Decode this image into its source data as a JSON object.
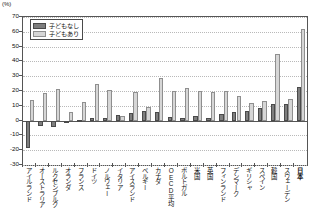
{
  "axis_unit_label": "(%)",
  "legend": {
    "position": "top-left-inside",
    "items": [
      {
        "key": "no_children",
        "label": "子どもなし",
        "color": "#7e7e7e"
      },
      {
        "key": "with_children",
        "label": "子どもあり",
        "color": "#d6d6d6"
      }
    ]
  },
  "chart_data": {
    "type": "bar",
    "title": "",
    "subtitle": "",
    "xlabel": "",
    "ylabel": "(%)",
    "ylim": [
      -30,
      70
    ],
    "yticks": [
      -30,
      -20,
      -10,
      0,
      10,
      20,
      30,
      40,
      50,
      60,
      70
    ],
    "ytick_labels": [
      "-30",
      "-20",
      "-10",
      "0",
      "10",
      "20",
      "30",
      "40",
      "50",
      "60",
      "70"
    ],
    "grid": true,
    "grid_axis": "y",
    "legend_entries": [
      "子どもなし",
      "子どもあり"
    ],
    "categories": [
      "アイルランド",
      "オーストラリア",
      "ルクセンブルク",
      "オランダ",
      "フランス",
      "ドイツ",
      "ノルウェー",
      "イタリア",
      "アイスランド",
      "ベルギー",
      "カナダ",
      "OECD平均",
      "ポルトガル",
      "米国",
      "英国",
      "フィンランド",
      "デンマーク",
      "ギリシャ",
      "スペイン",
      "韓国",
      "スウェーデン",
      "日本"
    ],
    "highlight_category": "日本",
    "series": [
      {
        "name": "子どもなし",
        "color": "#7e7e7e",
        "values": [
          -18.5,
          -3.5,
          -4.0,
          -1.5,
          0.5,
          1.5,
          2.0,
          3.5,
          5.0,
          6.5,
          6.0,
          2.5,
          2.0,
          3.0,
          2.0,
          4.5,
          6.0,
          6.5,
          8.5,
          11.0,
          11.5,
          23.0
        ]
      },
      {
        "name": "子どもあり",
        "color": "#d6d6d6",
        "values": [
          14.0,
          18.5,
          21.5,
          6.0,
          12.5,
          25.0,
          21.0,
          3.0,
          19.5,
          9.5,
          29.0,
          20.0,
          22.0,
          20.0,
          19.0,
          20.0,
          16.5,
          12.0,
          13.5,
          45.0,
          14.5,
          62.0
        ]
      }
    ]
  }
}
